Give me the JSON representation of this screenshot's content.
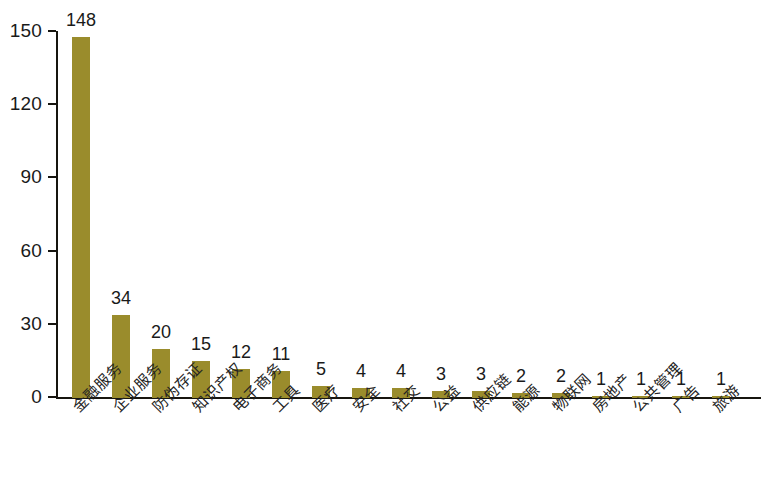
{
  "chart_data": {
    "type": "bar",
    "title": "",
    "subtitle": "",
    "xlabel": "",
    "ylabel": "",
    "ylim": [
      0,
      150
    ],
    "y_ticks": [
      0,
      30,
      60,
      90,
      120,
      150
    ],
    "grid": false,
    "legend": null,
    "bar_color": "#9a8c2c",
    "axis_color": "#17150f",
    "background": "#ffffff",
    "categories": [
      "金融服务",
      "企业服务",
      "防伪存证",
      "知识产权",
      "电子商务",
      "工具",
      "医疗",
      "安全",
      "社交",
      "公益",
      "供应链",
      "能源",
      "物联网",
      "房地产",
      "公共管理",
      "广告",
      "旅游"
    ],
    "values": [
      148,
      34,
      20,
      15,
      12,
      11,
      5,
      4,
      4,
      3,
      3,
      2,
      2,
      1,
      1,
      1,
      1
    ],
    "value_labels": [
      "148",
      "34",
      "20",
      "15",
      "12",
      "11",
      "5",
      "4",
      "4",
      "3",
      "3",
      "2",
      "2",
      "1",
      "1",
      "1",
      "1"
    ],
    "tick_labels": [
      "0",
      "30",
      "60",
      "90",
      "120",
      "150"
    ]
  }
}
